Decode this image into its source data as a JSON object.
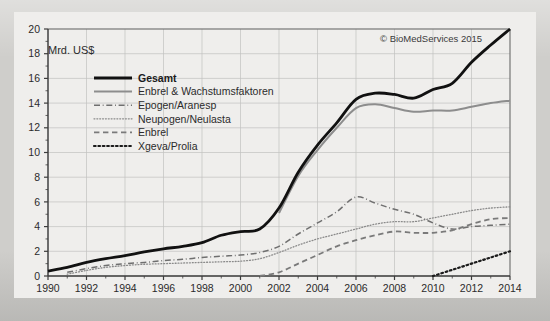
{
  "figure": {
    "unit_label": "Mrd. US$",
    "copyright": "© BioMedServices 2015",
    "background_color": "#cfcecb",
    "plot_background_color": "#efeeec",
    "grid_color": "#c2c2c0",
    "axis_color": "#3c3c3c"
  },
  "legend": {
    "position": "upper-left-inside",
    "entries": [
      {
        "label": "Gesamt",
        "style": "solid",
        "width": 2.8,
        "color": "#111111",
        "emphasis": "bold"
      },
      {
        "label": "Enbrel & Wachstumsfaktoren",
        "style": "solid",
        "width": 2.0,
        "color": "#8d8d8d",
        "emphasis": "normal"
      },
      {
        "label": "Epogen/Aranesp",
        "style": "dash-dot",
        "width": 1.5,
        "color": "#6f6f6f",
        "emphasis": "normal"
      },
      {
        "label": "Neupogen/Neulasta",
        "style": "fine-dotted",
        "width": 1.3,
        "color": "#8a8a8a",
        "emphasis": "normal"
      },
      {
        "label": "Enbrel",
        "style": "dashed",
        "width": 1.8,
        "color": "#7a7a7a",
        "emphasis": "normal"
      },
      {
        "label": "Xgeva/Prolia",
        "style": "bold-dotted",
        "width": 2.2,
        "color": "#1b1b1b",
        "emphasis": "normal"
      }
    ]
  },
  "chart_data": {
    "type": "line",
    "title": "",
    "subtitle": "",
    "xlabel": "",
    "ylabel": "Mrd. US$",
    "xlim": [
      1990,
      2014
    ],
    "ylim": [
      0,
      20
    ],
    "ytick_step": 2,
    "yticks": [
      0,
      2,
      4,
      6,
      8,
      10,
      12,
      14,
      16,
      18,
      20
    ],
    "xticks": [
      1990,
      1992,
      1994,
      1996,
      1998,
      2000,
      2002,
      2004,
      2006,
      2008,
      2010,
      2012,
      2014
    ],
    "xtick_labels": [
      "1990",
      "1992",
      "1994",
      "1996",
      "1998",
      "2000",
      "2002",
      "2004",
      "2006",
      "2008",
      "2010",
      "2012",
      "2014"
    ],
    "ytick_labels": [
      "0",
      "2",
      "4",
      "6",
      "8",
      "10",
      "12",
      "14",
      "16",
      "18",
      "20"
    ],
    "x_minor_ticks_every": 1,
    "grid": true,
    "grid_axis": "both",
    "legend_position": "upper left",
    "annotations": [
      {
        "text": "Mrd. US$",
        "x": 1991.0,
        "y": 18.8
      },
      {
        "text": "© BioMedServices 2015",
        "x": 2007.2,
        "y": 19.0
      }
    ],
    "series": [
      {
        "name": "Gesamt",
        "style": "solid",
        "x": [
          1990,
          1991,
          1992,
          1993,
          1994,
          1995,
          1996,
          1997,
          1998,
          1999,
          2000,
          2001,
          2002,
          2003,
          2004,
          2005,
          2006,
          2007,
          2008,
          2009,
          2010,
          2011,
          2012,
          2013,
          2014
        ],
        "values": [
          0.4,
          0.7,
          1.1,
          1.4,
          1.65,
          1.95,
          2.2,
          2.4,
          2.7,
          3.3,
          3.6,
          3.8,
          5.5,
          8.4,
          10.6,
          12.4,
          14.3,
          14.8,
          14.7,
          14.4,
          15.1,
          15.6,
          17.3,
          18.7,
          20.0
        ]
      },
      {
        "name": "Enbrel & Wachstumsfaktoren",
        "style": "solid",
        "x": [
          2002,
          2003,
          2004,
          2005,
          2006,
          2007,
          2008,
          2009,
          2010,
          2011,
          2012,
          2013,
          2014
        ],
        "values": [
          5.1,
          8.1,
          10.2,
          12.0,
          13.6,
          13.9,
          13.6,
          13.3,
          13.4,
          13.4,
          13.7,
          14.0,
          14.2
        ]
      },
      {
        "name": "Epogen/Aranesp",
        "style": "dash-dot",
        "x": [
          1991,
          1992,
          1993,
          1994,
          1995,
          1996,
          1997,
          1998,
          1999,
          2000,
          2001,
          2002,
          2003,
          2004,
          2005,
          2006,
          2007,
          2008,
          2009,
          2010,
          2011,
          2012,
          2013,
          2014
        ],
        "values": [
          0.3,
          0.6,
          0.85,
          1.0,
          1.1,
          1.25,
          1.35,
          1.5,
          1.6,
          1.7,
          1.9,
          2.4,
          3.4,
          4.3,
          5.2,
          6.4,
          5.9,
          5.4,
          5.0,
          4.3,
          3.8,
          4.0,
          4.1,
          4.2
        ]
      },
      {
        "name": "Neupogen/Neulasta",
        "style": "fine-dotted",
        "x": [
          1991,
          1992,
          1993,
          1994,
          1995,
          1996,
          1997,
          1998,
          1999,
          2000,
          2001,
          2002,
          2003,
          2004,
          2005,
          2006,
          2007,
          2008,
          2009,
          2010,
          2011,
          2012,
          2013,
          2014
        ],
        "values": [
          0.15,
          0.45,
          0.7,
          0.85,
          0.95,
          1.0,
          1.05,
          1.1,
          1.15,
          1.2,
          1.4,
          1.9,
          2.5,
          3.0,
          3.4,
          3.8,
          4.2,
          4.4,
          4.4,
          4.7,
          5.0,
          5.3,
          5.5,
          5.6
        ]
      },
      {
        "name": "Enbrel",
        "style": "dashed",
        "x": [
          2001,
          2002,
          2003,
          2004,
          2005,
          2006,
          2007,
          2008,
          2009,
          2010,
          2011,
          2012,
          2013,
          2014
        ],
        "values": [
          0.0,
          0.3,
          1.0,
          1.7,
          2.4,
          2.9,
          3.3,
          3.6,
          3.5,
          3.5,
          3.7,
          4.2,
          4.6,
          4.7
        ]
      },
      {
        "name": "Xgeva/Prolia",
        "style": "bold-dotted",
        "x": [
          2010,
          2011,
          2012,
          2013,
          2014
        ],
        "values": [
          0.0,
          0.5,
          1.0,
          1.5,
          2.0
        ]
      }
    ]
  }
}
